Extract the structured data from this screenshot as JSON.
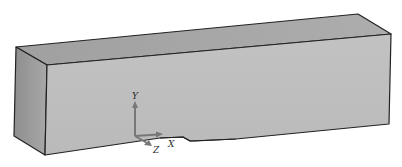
{
  "figure": {
    "colors": {
      "background": "#ffffff",
      "front_face": "#bdbdbd",
      "top_face": "#a9a9a9",
      "side_face": "#9c9c9c",
      "edge": "#222222",
      "axis_arrow": "#777777"
    },
    "axes": {
      "y_label": "Y",
      "x_label": "X",
      "z_label": "Z"
    }
  }
}
